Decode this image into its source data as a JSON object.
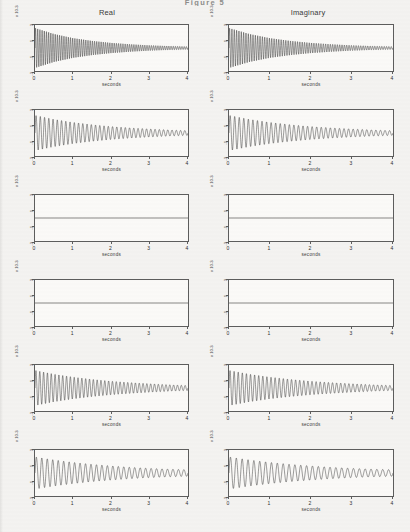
{
  "figure": {
    "title": "Figure 5"
  },
  "columns": [
    {
      "key": "real",
      "label": "Real"
    },
    {
      "key": "imaginary",
      "label": "Imaginary"
    }
  ],
  "axis": {
    "xlabel": "seconds",
    "xticks": [
      "0",
      "1",
      "2",
      "3",
      "4"
    ],
    "xlim": [
      0,
      4
    ],
    "yticks": [
      "3",
      "2",
      "1",
      "0",
      "-1",
      "-2",
      "-3"
    ],
    "yticks_shown": [
      "3",
      "1",
      "-1",
      "-3"
    ],
    "ylim": [
      -3,
      3
    ],
    "y_exponent_label": "x 10",
    "y_exponent_power": "-3",
    "grid": false
  },
  "chart_data": {
    "type": "line",
    "title": "Figure 5",
    "xlabel": "seconds",
    "ylabel": "amplitude (x 10^-3)",
    "xlim": [
      0,
      4
    ],
    "ylim": [
      -3,
      3
    ],
    "grid": false,
    "legend_position": "none",
    "column_headers": [
      "Real",
      "Imaginary"
    ],
    "series": [
      {
        "name": "row1-real",
        "row": 1,
        "column": "Real",
        "waveform": "damped-sinusoid",
        "amplitude_initial": 2.6,
        "amplitude_final": 0.18,
        "decay_rate": 0.72,
        "frequency_hz": 17.5,
        "mean": 0.0,
        "x": [
          0,
          0.5,
          1,
          1.5,
          2,
          2.5,
          3,
          3.5,
          4
        ],
        "envelope": [
          2.6,
          1.82,
          1.28,
          0.92,
          0.66,
          0.48,
          0.34,
          0.25,
          0.18
        ]
      },
      {
        "name": "row1-imaginary",
        "row": 1,
        "column": "Imaginary",
        "waveform": "damped-sinusoid",
        "amplitude_initial": 2.6,
        "amplitude_final": 0.18,
        "decay_rate": 0.72,
        "frequency_hz": 17.5,
        "mean": 0.0,
        "x": [
          0,
          0.5,
          1,
          1.5,
          2,
          2.5,
          3,
          3.5,
          4
        ],
        "envelope": [
          2.6,
          1.82,
          1.28,
          0.92,
          0.66,
          0.48,
          0.34,
          0.25,
          0.18
        ]
      },
      {
        "name": "row2-real",
        "row": 2,
        "column": "Real",
        "waveform": "damped-sinusoid",
        "amplitude_initial": 2.3,
        "amplitude_final": 0.3,
        "decay_rate": 0.52,
        "frequency_hz": 9.0,
        "mean": 0.0,
        "x": [
          0,
          0.5,
          1,
          1.5,
          2,
          2.5,
          3,
          3.5,
          4
        ],
        "envelope": [
          2.3,
          1.78,
          1.38,
          1.08,
          0.84,
          0.66,
          0.52,
          0.4,
          0.3
        ]
      },
      {
        "name": "row2-imaginary",
        "row": 2,
        "column": "Imaginary",
        "waveform": "damped-sinusoid",
        "amplitude_initial": 2.3,
        "amplitude_final": 0.3,
        "decay_rate": 0.52,
        "frequency_hz": 9.0,
        "mean": 0.0,
        "x": [
          0,
          0.5,
          1,
          1.5,
          2,
          2.5,
          3,
          3.5,
          4
        ],
        "envelope": [
          2.3,
          1.78,
          1.38,
          1.08,
          0.84,
          0.66,
          0.52,
          0.4,
          0.3
        ]
      },
      {
        "name": "row3-real",
        "row": 3,
        "column": "Real",
        "waveform": "zero",
        "amplitude_initial": 0,
        "amplitude_final": 0,
        "decay_rate": 0,
        "frequency_hz": 0,
        "mean": 0.0,
        "x": [
          0,
          1,
          2,
          3,
          4
        ],
        "envelope": [
          0,
          0,
          0,
          0,
          0
        ]
      },
      {
        "name": "row3-imaginary",
        "row": 3,
        "column": "Imaginary",
        "waveform": "zero",
        "amplitude_initial": 0,
        "amplitude_final": 0,
        "decay_rate": 0,
        "frequency_hz": 0,
        "mean": 0.0,
        "x": [
          0,
          1,
          2,
          3,
          4
        ],
        "envelope": [
          0,
          0,
          0,
          0,
          0
        ]
      },
      {
        "name": "row4-real",
        "row": 4,
        "column": "Real",
        "waveform": "zero",
        "amplitude_initial": 0,
        "amplitude_final": 0,
        "decay_rate": 0,
        "frequency_hz": 0,
        "mean": 0.0,
        "x": [
          0,
          1,
          2,
          3,
          4
        ],
        "envelope": [
          0,
          0,
          0,
          0,
          0
        ]
      },
      {
        "name": "row4-imaginary",
        "row": 4,
        "column": "Imaginary",
        "waveform": "zero",
        "amplitude_initial": 0,
        "amplitude_final": 0,
        "decay_rate": 0,
        "frequency_hz": 0,
        "mean": 0.0,
        "x": [
          0,
          1,
          2,
          3,
          4
        ],
        "envelope": [
          0,
          0,
          0,
          0,
          0
        ]
      },
      {
        "name": "row5-real",
        "row": 5,
        "column": "Real",
        "waveform": "damped-sinusoid",
        "amplitude_initial": 2.3,
        "amplitude_final": 0.32,
        "decay_rate": 0.5,
        "frequency_hz": 10.0,
        "mean": 0.0,
        "x": [
          0,
          0.5,
          1,
          1.5,
          2,
          2.5,
          3,
          3.5,
          4
        ],
        "envelope": [
          2.3,
          1.8,
          1.42,
          1.12,
          0.88,
          0.7,
          0.55,
          0.42,
          0.32
        ]
      },
      {
        "name": "row5-imaginary",
        "row": 5,
        "column": "Imaginary",
        "waveform": "damped-sinusoid",
        "amplitude_initial": 2.3,
        "amplitude_final": 0.32,
        "decay_rate": 0.5,
        "frequency_hz": 10.0,
        "mean": 0.0,
        "x": [
          0,
          0.5,
          1,
          1.5,
          2,
          2.5,
          3,
          3.5,
          4
        ],
        "envelope": [
          2.3,
          1.8,
          1.42,
          1.12,
          0.88,
          0.7,
          0.55,
          0.42,
          0.32
        ]
      },
      {
        "name": "row6-real",
        "row": 6,
        "column": "Real",
        "waveform": "damped-sinusoid",
        "amplitude_initial": 2.1,
        "amplitude_final": 0.42,
        "decay_rate": 0.42,
        "frequency_hz": 7.0,
        "mean": 0.0,
        "x": [
          0,
          0.5,
          1,
          1.5,
          2,
          2.5,
          3,
          3.5,
          4
        ],
        "envelope": [
          2.1,
          1.7,
          1.38,
          1.12,
          0.92,
          0.74,
          0.6,
          0.5,
          0.42
        ]
      },
      {
        "name": "row6-imaginary",
        "row": 6,
        "column": "Imaginary",
        "waveform": "damped-sinusoid",
        "amplitude_initial": 2.1,
        "amplitude_final": 0.42,
        "decay_rate": 0.42,
        "frequency_hz": 7.0,
        "mean": 0.0,
        "x": [
          0,
          0.5,
          1,
          1.5,
          2,
          2.5,
          3,
          3.5,
          4
        ],
        "envelope": [
          2.1,
          1.7,
          1.38,
          1.12,
          0.92,
          0.74,
          0.6,
          0.5,
          0.42
        ]
      }
    ]
  },
  "colors": {
    "page_background": "#f4f3f1",
    "plot_background": "#fbfaf8",
    "axis_line": "#5d5d5d",
    "trace": "#111111",
    "text": "#2a2a2a"
  }
}
